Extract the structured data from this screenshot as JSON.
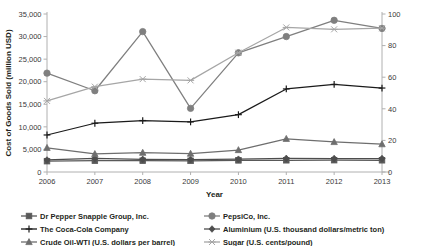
{
  "chart_data": {
    "type": "line",
    "title": "",
    "xlabel": "Year",
    "ylabel": "Cost of Goods Sold (million USD)",
    "y2label": "",
    "categories": [
      "2006",
      "2007",
      "2008",
      "2009",
      "2010",
      "2011",
      "2012",
      "2013"
    ],
    "x": [
      2006,
      2007,
      2008,
      2009,
      2010,
      2011,
      2012,
      2013
    ],
    "ylim": [
      0,
      35000
    ],
    "y2lim": [
      0,
      100
    ],
    "yticks": [
      "0",
      "5,000",
      "10,000",
      "15,000",
      "20,000",
      "25,000",
      "30,000",
      "35,000"
    ],
    "ytick_values": [
      0,
      5000,
      10000,
      15000,
      20000,
      25000,
      30000,
      35000
    ],
    "y2ticks": [
      "0",
      "20",
      "40",
      "60",
      "80",
      "100"
    ],
    "y2tick_values": [
      0,
      20,
      40,
      60,
      80,
      100
    ],
    "grid": false,
    "legend_position": "bottom",
    "series": [
      {
        "name": "Dr Pepper Snapple Group, Inc.",
        "axis": "left",
        "marker": "square",
        "color": "#595959",
        "values": [
          2400,
          2500,
          2500,
          2480,
          2580,
          2600,
          2620,
          2600
        ]
      },
      {
        "name": "PepsiCo, Inc.",
        "axis": "left",
        "marker": "circle",
        "color": "#7f7f7f",
        "values": [
          21900,
          18000,
          31100,
          14100,
          26400,
          30000,
          33600,
          31800
        ]
      },
      {
        "name": "The Coca-Cola Company",
        "axis": "left",
        "marker": "plus",
        "color": "#1a1a1a",
        "values": [
          8200,
          10800,
          11400,
          11100,
          12700,
          18400,
          19400,
          18600
        ]
      },
      {
        "name": "Aluminium (U.S. thousand dollars/metric ton)",
        "axis": "right",
        "marker": "diamond",
        "color": "#4d4d4d",
        "values": [
          7.6,
          8.6,
          8.0,
          7.9,
          8.1,
          8.6,
          8.5,
          8.5
        ]
      },
      {
        "name": "Crude Oil-WTI (U.S. dollars per barrel)",
        "axis": "right",
        "marker": "triangle",
        "color": "#6e6e6e",
        "values": [
          15.3,
          11.4,
          12.2,
          11.6,
          13.9,
          21.0,
          19.0,
          17.6
        ]
      },
      {
        "name": "Sugar (U.S. cents/pound)",
        "axis": "right",
        "marker": "asterisk",
        "color": "#a6a6a6",
        "values": [
          45.0,
          54.0,
          58.8,
          58.0,
          75.5,
          91.5,
          90.3,
          91.0
        ]
      }
    ]
  },
  "legend": {
    "column1": [
      {
        "label": "Dr Pepper Snapple Group, Inc.",
        "marker": "square",
        "color": "#595959"
      },
      {
        "label": "The Coca-Cola Company",
        "marker": "plus",
        "color": "#1a1a1a"
      },
      {
        "label": "Crude Oil-WTI (U.S. dollars per barrel)",
        "marker": "triangle",
        "color": "#6e6e6e"
      }
    ],
    "column2": [
      {
        "label": "PepsiCo, Inc.",
        "marker": "circle",
        "color": "#7f7f7f"
      },
      {
        "label": "Aluminium (U.S. thousand dollars/metric ton)",
        "marker": "diamond",
        "color": "#4d4d4d"
      },
      {
        "label": "Sugar (U.S. cents/pound)",
        "marker": "asterisk",
        "color": "#a6a6a6"
      }
    ]
  },
  "colors": {
    "axis": "#b0b0b0",
    "text": "#231f20",
    "background": "#ffffff"
  }
}
